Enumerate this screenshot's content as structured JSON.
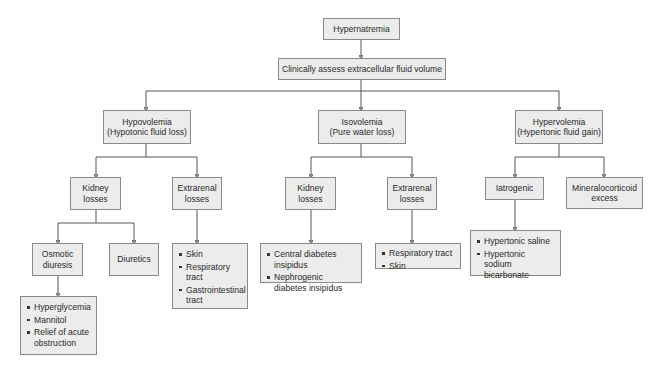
{
  "diagram": {
    "root": "Hypernatremia",
    "assess": "Clinically assess extracellular fluid volume",
    "branches": [
      {
        "title": "Hypovolemia",
        "subtitle": "(Hypotonic fluid loss)",
        "children": [
          {
            "title": "Kidney",
            "title2": "losses",
            "children": [
              {
                "title": "Osmotic",
                "title2": "diuresis",
                "items": [
                  "Hyperglycemia",
                  "Mannitol",
                  "Relief of acute obstruction"
                ]
              },
              {
                "title": "Diuretics"
              }
            ]
          },
          {
            "title": "Extrarenal",
            "title2": "losses",
            "items": [
              "Skin",
              "Respiratory tract",
              "Gastrointestinal tract"
            ]
          }
        ]
      },
      {
        "title": "Isovolemia",
        "subtitle": "(Pure water loss)",
        "children": [
          {
            "title": "Kidney",
            "title2": "losses",
            "items": [
              "Central diabetes insipidus",
              "Nephrogenic diabetes insipidus"
            ]
          },
          {
            "title": "Extrarenal",
            "title2": "losses",
            "items": [
              "Respiratory tract",
              "Skin"
            ]
          }
        ]
      },
      {
        "title": "Hypervolemia",
        "subtitle": "(Hypertonic fluid gain)",
        "children": [
          {
            "title": "Iatrogenic",
            "items": [
              "Hypertonic saline",
              "Hypertonic sodium bicarbonate"
            ]
          },
          {
            "title": "Mineralocorticoid",
            "title2": "excess"
          }
        ]
      }
    ]
  },
  "colors": {
    "box_fill": "#ececec",
    "box_border": "#8a8a8a",
    "line": "#555555",
    "text": "#2a2a2a"
  }
}
